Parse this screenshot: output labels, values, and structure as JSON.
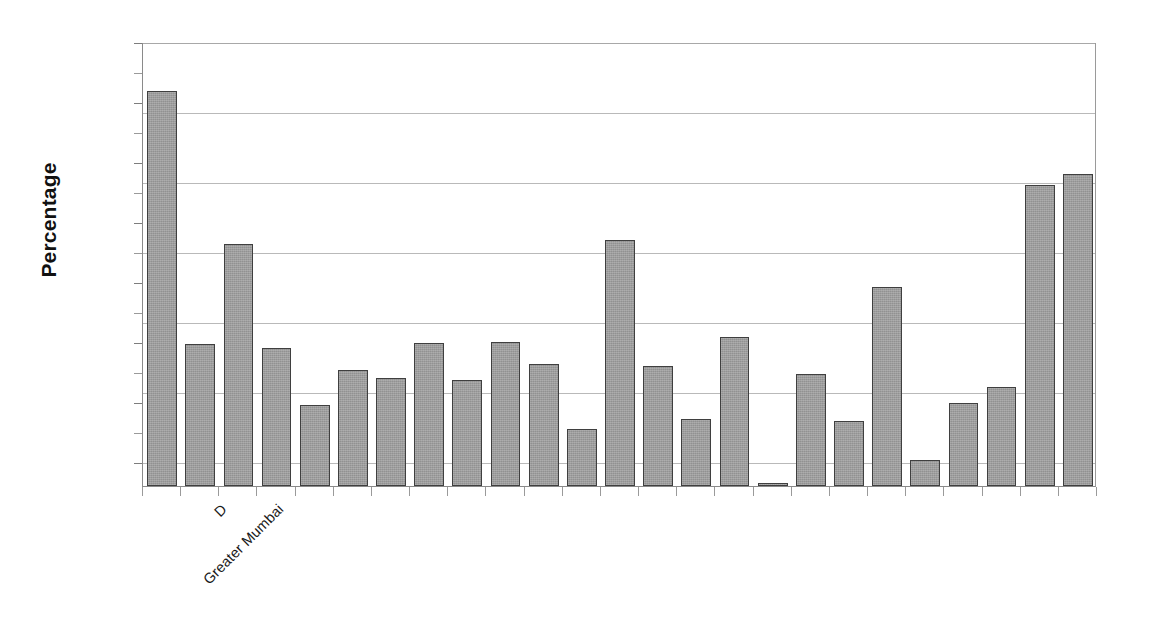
{
  "chart_data": {
    "type": "bar",
    "title": "",
    "subtitle": "",
    "xlabel": "",
    "ylabel": "Percentage",
    "ylim": [
      0,
      70
    ],
    "grid": true,
    "grid_axis": "y",
    "legend": false,
    "legend_position": "none",
    "axis_tick_labels_visible": false,
    "y_tick_values": [
      0,
      10,
      20,
      30,
      40,
      50,
      60,
      70
    ],
    "bar_color": "#9d9d9d",
    "bar_border_color": "#3f3f3f",
    "gridline_color": "#b9b9b9",
    "axis_color": "#8a8a8a",
    "categories": [
      "Greater Mumbai",
      "D",
      "",
      "",
      "",
      "",
      "",
      "",
      "",
      "",
      "",
      "",
      "",
      "",
      "",
      "",
      "",
      "",
      "",
      "",
      "",
      "",
      "",
      "",
      ""
    ],
    "visible_category_labels": [
      {
        "index": 0,
        "text": "Greater Mumbai"
      },
      {
        "index": 1,
        "text": "D"
      }
    ],
    "values": [
      62.3,
      22.4,
      38.2,
      21.8,
      12.8,
      18.3,
      17.0,
      22.5,
      16.7,
      22.7,
      19.2,
      9.0,
      38.8,
      18.9,
      10.6,
      23.5,
      0.4,
      17.7,
      10.2,
      31.4,
      4.1,
      13.1,
      15.6,
      47.5,
      49.2
    ],
    "trailing_values": [
      13.1,
      13.1
    ],
    "n_bars": 25
  },
  "axis": {
    "y_title": "Percentage"
  }
}
